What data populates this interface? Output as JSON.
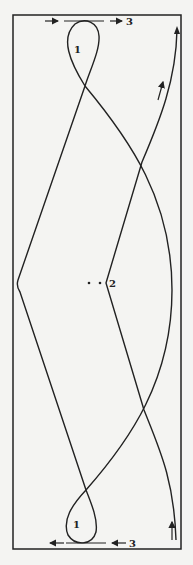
{
  "diagram": {
    "labels": {
      "loop_top": "1",
      "loop_bottom": "1",
      "center": "2",
      "arrow_top": "3",
      "arrow_bottom": "3"
    },
    "colors": {
      "stroke": "#222222",
      "background": "#f4f4f2"
    }
  }
}
